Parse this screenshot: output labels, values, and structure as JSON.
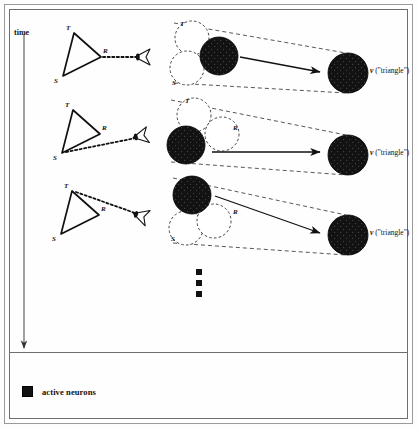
{
  "figure": {
    "background_color": "#fefefe",
    "ink_color": "#111111",
    "active_fill_color": "#121212",
    "time_axis": {
      "label": "time",
      "direction": "downward",
      "x": 24,
      "y_start": 34,
      "y_end": 348
    },
    "legend": {
      "swatch_color": "#121212",
      "label": "active neurons"
    },
    "ellipsis": {
      "symbol": "vertical-dots",
      "dot_count": 3,
      "x": 199,
      "y_values": [
        272,
        283,
        294
      ]
    }
  },
  "rows": [
    {
      "id": "row-1",
      "time_index": 1,
      "stimulus": {
        "shape": "triangle",
        "vertices": [
          {
            "label": "T",
            "x": 74,
            "y": 33,
            "label_x": 66,
            "label_y": 24
          },
          {
            "label": "S",
            "x": 63,
            "y": 76,
            "label_x": 54,
            "label_y": 77
          },
          {
            "label": "R",
            "x": 101,
            "y": 57,
            "label_x": 103,
            "label_y": 47
          }
        ],
        "gaze_from": "R",
        "gaze_line": {
          "x1": 103,
          "y1": 57,
          "x2": 138,
          "y2": 57
        },
        "eye": {
          "x": 143,
          "y": 57,
          "rotation": 0
        }
      },
      "neuron_cluster": {
        "circles": [
          {
            "label": "T",
            "x": 192,
            "y": 38,
            "r": 17,
            "active": false,
            "label_x": 180,
            "label_y": 20
          },
          {
            "label": "S",
            "x": 187,
            "y": 68,
            "r": 17,
            "active": false,
            "label_x": 172,
            "label_y": 79
          },
          {
            "label": "R",
            "x": 219,
            "y": 56,
            "r": 19,
            "active": true,
            "label_x": 231,
            "label_y": 45
          }
        ]
      },
      "arrow": {
        "x1": 240,
        "y1": 57,
        "x2": 320,
        "y2": 72
      },
      "output": {
        "x": 348,
        "y": 73,
        "r": 20,
        "active": true,
        "label_symbol": "v",
        "label_text": "(\"triangle\")",
        "label_x": 370,
        "label_y": 66
      }
    },
    {
      "id": "row-2",
      "time_index": 2,
      "stimulus": {
        "shape": "triangle",
        "vertices": [
          {
            "label": "T",
            "x": 73,
            "y": 110,
            "label_x": 65,
            "label_y": 101
          },
          {
            "label": "S",
            "x": 62,
            "y": 153,
            "label_x": 53,
            "label_y": 154
          },
          {
            "label": "R",
            "x": 100,
            "y": 134,
            "label_x": 102,
            "label_y": 124
          }
        ],
        "gaze_from": "S",
        "gaze_line": {
          "x1": 66,
          "y1": 152,
          "x2": 136,
          "y2": 138
        },
        "eye": {
          "x": 141,
          "y": 136,
          "rotation": -11
        }
      },
      "neuron_cluster": {
        "circles": [
          {
            "label": "T",
            "x": 194,
            "y": 115,
            "r": 17,
            "active": false,
            "label_x": 185,
            "label_y": 97
          },
          {
            "label": "R",
            "x": 222,
            "y": 134,
            "r": 17,
            "active": false,
            "label_x": 233,
            "label_y": 124
          },
          {
            "label": "S",
            "x": 186,
            "y": 145,
            "r": 19,
            "active": true,
            "label_x": 170,
            "label_y": 150
          }
        ]
      },
      "arrow": {
        "x1": 212,
        "y1": 152,
        "x2": 320,
        "y2": 152
      },
      "output": {
        "x": 348,
        "y": 155,
        "r": 20,
        "active": true,
        "label_symbol": "v",
        "label_text": "(\"triangle\")",
        "label_x": 370,
        "label_y": 148
      }
    },
    {
      "id": "row-3",
      "time_index": 3,
      "stimulus": {
        "shape": "triangle",
        "vertices": [
          {
            "label": "T",
            "x": 72,
            "y": 191,
            "label_x": 64,
            "label_y": 182
          },
          {
            "label": "S",
            "x": 61,
            "y": 234,
            "label_x": 52,
            "label_y": 235
          },
          {
            "label": "R",
            "x": 99,
            "y": 215,
            "label_x": 101,
            "label_y": 205
          }
        ],
        "gaze_from": "T",
        "gaze_line": {
          "x1": 76,
          "y1": 192,
          "x2": 135,
          "y2": 213
        },
        "eye": {
          "x": 141,
          "y": 216,
          "rotation": 18
        }
      },
      "neuron_cluster": {
        "circles": [
          {
            "label": "S",
            "x": 186,
            "y": 228,
            "r": 17,
            "active": false,
            "label_x": 171,
            "label_y": 235
          },
          {
            "label": "R",
            "x": 214,
            "y": 221,
            "r": 17,
            "active": false,
            "label_x": 233,
            "label_y": 208
          },
          {
            "label": "T",
            "x": 192,
            "y": 195,
            "r": 19,
            "active": true,
            "label_x": 185,
            "label_y": 180
          }
        ]
      },
      "arrow": {
        "x1": 215,
        "y1": 196,
        "x2": 320,
        "y2": 233
      },
      "output": {
        "x": 348,
        "y": 235,
        "r": 20,
        "active": true,
        "label_symbol": "v",
        "label_text": "(\"triangle\")",
        "label_x": 370,
        "label_y": 228
      }
    }
  ]
}
